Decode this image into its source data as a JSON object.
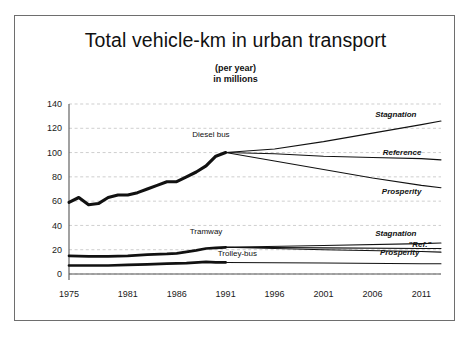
{
  "chart_data": {
    "type": "line",
    "title": "Total vehicle-km in urban transport",
    "subtitle_line1": "(per year)",
    "subtitle_line2": "in millions",
    "xlabel": "",
    "ylabel": "",
    "grid": true,
    "legend_position": "inline-labels",
    "xlim": [
      1975,
      2013
    ],
    "ylim": [
      0,
      140
    ],
    "xticks": [
      "1975",
      "1981",
      "1986",
      "1991",
      "1996",
      "2001",
      "2006",
      "2011"
    ],
    "xtick_values": [
      1975,
      1981,
      1986,
      1991,
      1996,
      2001,
      2006,
      2011
    ],
    "yticks": [
      "0",
      "20",
      "40",
      "60",
      "80",
      "100",
      "120",
      "140"
    ],
    "ytick_values": [
      0,
      20,
      40,
      60,
      80,
      100,
      120,
      140
    ],
    "inline_labels": [
      {
        "text": "Diesel bus",
        "x": 1989.5,
        "y": 113
      },
      {
        "text": "Tramway",
        "x": 1989.0,
        "y": 33
      },
      {
        "text": "Trolley-bus",
        "x": 1992.2,
        "y": 14.5
      }
    ],
    "scenario_labels": [
      {
        "text": "Stagnation",
        "series": "diesel-bus-stagnation",
        "x": 2010.5,
        "y": 129
      },
      {
        "text": "Reference",
        "series": "diesel-bus-reference",
        "x": 2011.0,
        "y": 98
      },
      {
        "text": "Prosperity",
        "series": "diesel-bus-prosperity",
        "x": 2011.0,
        "y": 66
      },
      {
        "text": "Stagnation",
        "series": "tramway-stagnation",
        "x": 2010.5,
        "y": 31
      },
      {
        "text": "\"Ref.\"",
        "series": "tramway-reference",
        "x": 2012.0,
        "y": 22.5
      },
      {
        "text": "Prosperity",
        "series": "tramway-prosperity",
        "x": 2010.8,
        "y": 15.5
      }
    ],
    "series": [
      {
        "name": "Diesel bus (historic)",
        "phase": "historic",
        "weight": "heavy",
        "x": [
          1975,
          1976,
          1977,
          1978,
          1979,
          1980,
          1981,
          1982,
          1983,
          1984,
          1985,
          1986,
          1987,
          1988,
          1989,
          1990,
          1991
        ],
        "values": [
          59,
          63,
          57,
          58,
          63,
          65,
          65,
          67,
          70,
          73,
          76,
          76,
          80,
          84,
          89,
          97,
          100
        ]
      },
      {
        "name": "Diesel bus — Stagnation",
        "phase": "projection",
        "weight": "thin",
        "x": [
          1991,
          1996,
          2001,
          2006,
          2011,
          2013
        ],
        "values": [
          100,
          103,
          109,
          116,
          123,
          126
        ]
      },
      {
        "name": "Diesel bus — Reference",
        "phase": "projection",
        "weight": "thin",
        "x": [
          1991,
          1996,
          2001,
          2006,
          2011,
          2013
        ],
        "values": [
          100,
          99,
          97,
          96,
          95,
          94
        ]
      },
      {
        "name": "Diesel bus — Prosperity",
        "phase": "projection",
        "weight": "thin",
        "x": [
          1991,
          1996,
          2001,
          2006,
          2011,
          2013
        ],
        "values": [
          100,
          93,
          86,
          79,
          73,
          71
        ]
      },
      {
        "name": "Tramway (historic)",
        "phase": "historic",
        "weight": "heavy",
        "x": [
          1975,
          1977,
          1979,
          1981,
          1983,
          1985,
          1986,
          1988,
          1989,
          1990,
          1991
        ],
        "values": [
          15,
          14.5,
          14.5,
          15,
          16,
          16.5,
          17,
          19.5,
          21,
          21.5,
          22
        ]
      },
      {
        "name": "Tramway — Stagnation",
        "phase": "projection",
        "weight": "thin",
        "x": [
          1991,
          2001,
          2011,
          2013
        ],
        "values": [
          22,
          23.5,
          25,
          25.5
        ]
      },
      {
        "name": "Tramway — Reference",
        "phase": "projection",
        "weight": "thin",
        "x": [
          1991,
          2001,
          2011,
          2013
        ],
        "values": [
          22,
          21.5,
          21,
          21
        ]
      },
      {
        "name": "Tramway — Prosperity",
        "phase": "projection",
        "weight": "thin",
        "x": [
          1991,
          2001,
          2011,
          2013
        ],
        "values": [
          22,
          20,
          18.5,
          18
        ]
      },
      {
        "name": "Trolley-bus (historic)",
        "phase": "historic",
        "weight": "heavy",
        "x": [
          1975,
          1977,
          1979,
          1981,
          1983,
          1985,
          1987,
          1989,
          1990,
          1991
        ],
        "values": [
          7,
          7,
          7,
          7.5,
          8,
          8.5,
          9,
          10,
          9.5,
          9.5
        ]
      },
      {
        "name": "Trolley-bus — projection",
        "phase": "projection",
        "weight": "thin",
        "x": [
          1991,
          2001,
          2011,
          2013
        ],
        "values": [
          9.5,
          9,
          8.5,
          8.5
        ]
      }
    ],
    "colors": {
      "line": "#111111",
      "grid": "#b9b9b9",
      "axis": "#555555",
      "background": "#ffffff",
      "frame": "#6e6e6e"
    }
  }
}
